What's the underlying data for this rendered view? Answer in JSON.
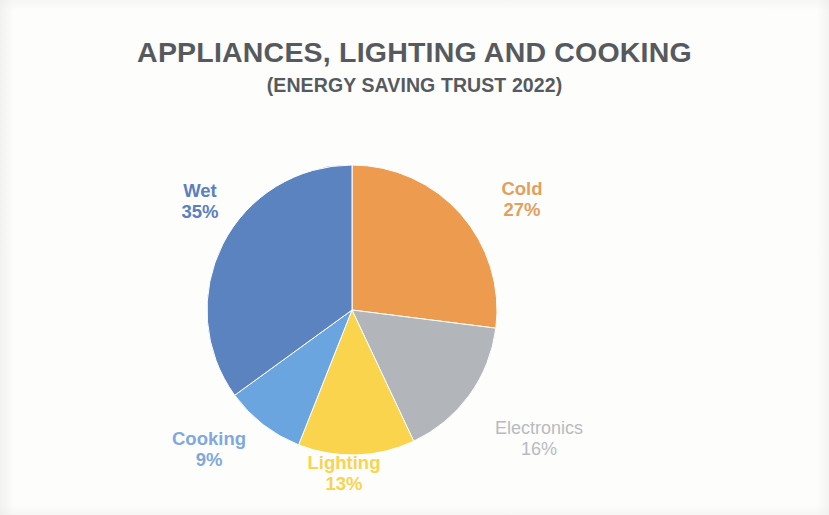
{
  "chart_data": {
    "type": "pie",
    "title": "APPLIANCES, LIGHTING AND COOKING",
    "subtitle": "(ENERGY SAVING TRUST 2022)",
    "categories": [
      "Cold",
      "Electronics",
      "Lighting",
      "Cooking",
      "Wet"
    ],
    "values": [
      27,
      16,
      13,
      9,
      35
    ],
    "value_unit": "%",
    "start_angle_deg": 0,
    "direction": "clockwise",
    "legend": "none",
    "labels_inline": true,
    "slices": [
      {
        "name": "Cold",
        "value": 27,
        "value_label": "27%",
        "color": "#ed9c4f",
        "label_color": "#e3a05c"
      },
      {
        "name": "Electronics",
        "value": 16,
        "value_label": "16%",
        "color": "#b2b6ba",
        "label_color": "#b7bbbf"
      },
      {
        "name": "Lighting",
        "value": 13,
        "value_label": "13%",
        "color": "#fbd44d",
        "label_color": "#fad34f"
      },
      {
        "name": "Cooking",
        "value": 9,
        "value_label": "9%",
        "color": "#6ba5e0",
        "label_color": "#7fa9dd"
      },
      {
        "name": "Wet",
        "value": 35,
        "value_label": "35%",
        "color": "#5b83c0",
        "label_color": "#5b7fc0"
      }
    ]
  },
  "colors": {
    "title_text": "#565a5e",
    "background": "#fdfdfc",
    "cold": "#ed9c4f",
    "electronics": "#b2b6ba",
    "lighting": "#fbd44d",
    "cooking": "#6ba5e0",
    "wet": "#5b83c0"
  }
}
